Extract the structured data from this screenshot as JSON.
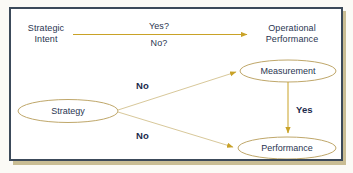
{
  "diagram": {
    "colors": {
      "frame_border": "#3c4a5a",
      "frame_shadow": "#c9bd94",
      "page_background": "#fbfaf6",
      "arrow_gold": "#c9a227",
      "arrow_gold_light": "#d8c89a",
      "ellipse_stroke": "#bfa76a",
      "text_navy": "#2a3551",
      "text_bold_navy": "#1d2a4d"
    },
    "nodes": [
      {
        "id": "strategic-intent",
        "label_line1": "Strategic",
        "label_line2": "Intent",
        "shape": "text"
      },
      {
        "id": "operational-performance",
        "label_line1": "Operational",
        "label_line2": "Performance",
        "shape": "text"
      },
      {
        "id": "measurement",
        "label_line1": "Measurement",
        "shape": "ellipse"
      },
      {
        "id": "strategy",
        "label_line1": "Strategy",
        "shape": "ellipse"
      },
      {
        "id": "performance",
        "label_line1": "Performance",
        "shape": "ellipse"
      }
    ],
    "edge_labels": {
      "yes_question": "Yes?",
      "no_question": "No?",
      "no_upper": "No",
      "no_lower": "No",
      "yes_vertical": "Yes"
    }
  }
}
